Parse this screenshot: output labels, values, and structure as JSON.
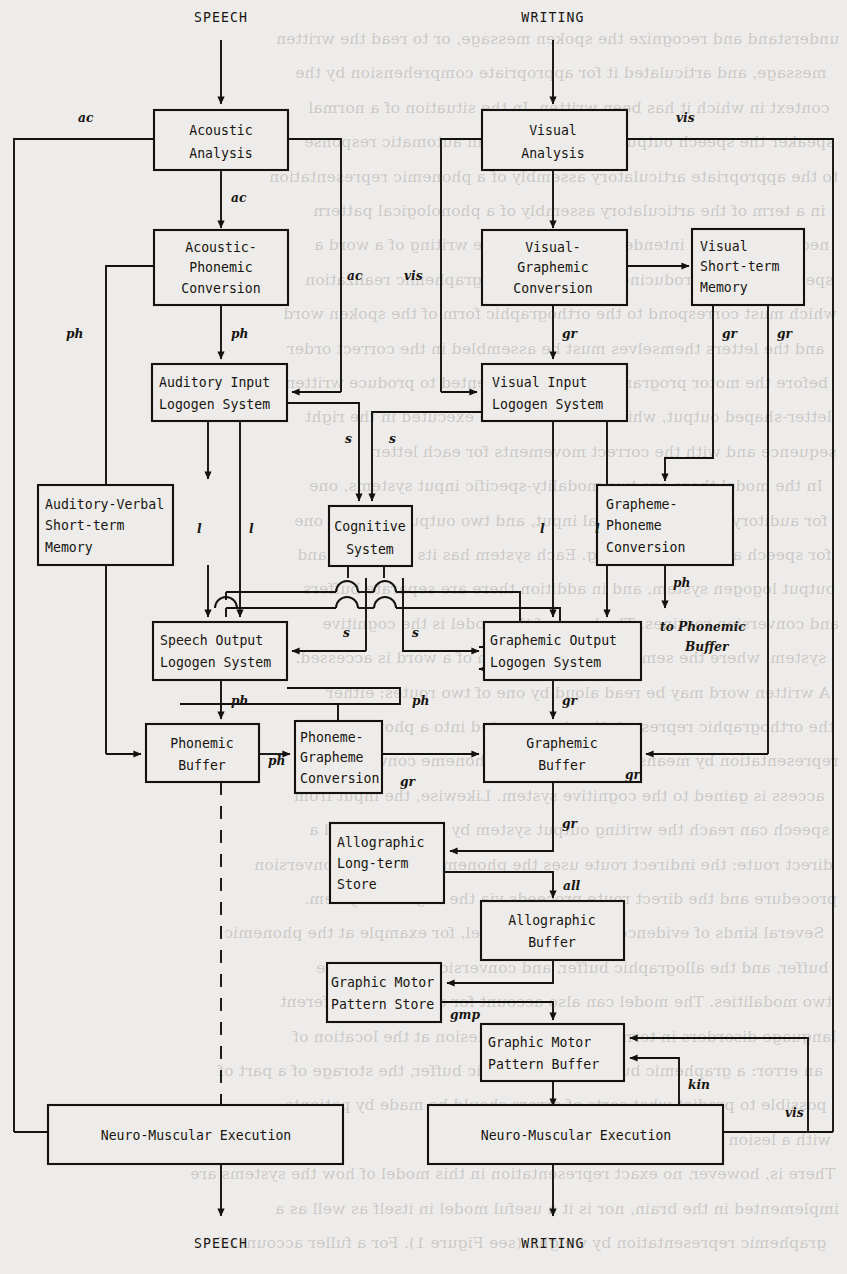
{
  "diagram": {
    "io_labels": {
      "speech_in": "SPEECH",
      "writing_in": "WRITING",
      "speech_out": "SPEECH",
      "writing_out": "WRITING"
    },
    "boxes": [
      {
        "id": "acoustic_analysis",
        "lines": [
          "Acoustic",
          "Analysis"
        ]
      },
      {
        "id": "visual_analysis",
        "lines": [
          "Visual",
          "Analysis"
        ]
      },
      {
        "id": "acoustic_phonemic",
        "lines": [
          "Acoustic-",
          "Phonemic",
          "Conversion"
        ]
      },
      {
        "id": "visual_graphemic",
        "lines": [
          "Visual-",
          "Graphemic",
          "Conversion"
        ]
      },
      {
        "id": "visual_stm",
        "lines": [
          "Visual",
          "Short-term",
          "Memory"
        ]
      },
      {
        "id": "auditory_input",
        "lines": [
          "Auditory Input",
          "Logogen System"
        ]
      },
      {
        "id": "visual_input",
        "lines": [
          "Visual Input",
          "Logogen System"
        ]
      },
      {
        "id": "auditory_verbal_stm",
        "lines": [
          "Auditory-Verbal",
          "Short-term",
          "Memory"
        ]
      },
      {
        "id": "cognitive_system",
        "lines": [
          "Cognitive",
          "System"
        ]
      },
      {
        "id": "grapheme_phoneme",
        "lines": [
          "Grapheme-",
          "Phoneme",
          "Conversion"
        ]
      },
      {
        "id": "speech_output",
        "lines": [
          "Speech Output",
          "Logogen System"
        ]
      },
      {
        "id": "graphemic_output",
        "lines": [
          "Graphemic Output",
          "Logogen System"
        ]
      },
      {
        "id": "phonemic_buffer",
        "lines": [
          "Phonemic",
          "Buffer"
        ]
      },
      {
        "id": "phoneme_grapheme",
        "lines": [
          "Phoneme-",
          "Grapheme",
          "Conversion"
        ]
      },
      {
        "id": "graphemic_buffer",
        "lines": [
          "Graphemic",
          "Buffer"
        ]
      },
      {
        "id": "allographic_lts",
        "lines": [
          "Allographic",
          "Long-term",
          "Store"
        ]
      },
      {
        "id": "allographic_buffer",
        "lines": [
          "Allographic",
          "Buffer"
        ]
      },
      {
        "id": "gmp_store",
        "lines": [
          "Graphic Motor",
          "Pattern Store"
        ]
      },
      {
        "id": "gmp_buffer",
        "lines": [
          "Graphic Motor",
          "Pattern Buffer"
        ]
      },
      {
        "id": "nme_speech",
        "lines": [
          "Neuro-Muscular Execution"
        ]
      },
      {
        "id": "nme_writing",
        "lines": [
          "Neuro-Muscular Execution"
        ]
      }
    ],
    "edge_labels": [
      {
        "id": "ac_left",
        "text": "ac"
      },
      {
        "id": "vis_right",
        "text": "vis"
      },
      {
        "id": "ac_down1",
        "text": "ac"
      },
      {
        "id": "ac_mid",
        "text": "ac"
      },
      {
        "id": "vis_mid",
        "text": "vis"
      },
      {
        "id": "ph_aux",
        "text": "ph"
      },
      {
        "id": "ph_down1",
        "text": "ph"
      },
      {
        "id": "gr_down1",
        "text": "gr"
      },
      {
        "id": "gr_stm_a",
        "text": "gr"
      },
      {
        "id": "gr_stm_b",
        "text": "gr"
      },
      {
        "id": "s_left_up",
        "text": "s"
      },
      {
        "id": "s_right_up",
        "text": "s"
      },
      {
        "id": "l_1",
        "text": "l"
      },
      {
        "id": "l_2",
        "text": "l"
      },
      {
        "id": "l_3",
        "text": "l"
      },
      {
        "id": "l_4",
        "text": "l"
      },
      {
        "id": "s_left_dn",
        "text": "s"
      },
      {
        "id": "s_right_dn",
        "text": "s"
      },
      {
        "id": "ph_gp_out",
        "text": "ph"
      },
      {
        "id": "to_phonemic",
        "text": "to Phonemic"
      },
      {
        "id": "to_phonemic_2",
        "text": "Buffer"
      },
      {
        "id": "ph_speech_out",
        "text": "ph"
      },
      {
        "id": "ph_top_right",
        "text": "ph"
      },
      {
        "id": "gr_go_out",
        "text": "gr"
      },
      {
        "id": "ph_pb_out",
        "text": "ph"
      },
      {
        "id": "gr_pgc_out",
        "text": "gr"
      },
      {
        "id": "gr_vstm_in",
        "text": "gr"
      },
      {
        "id": "gr_gb_down",
        "text": "gr"
      },
      {
        "id": "all_label",
        "text": "all"
      },
      {
        "id": "gmp_label",
        "text": "gmp"
      },
      {
        "id": "kin_label",
        "text": "kin"
      },
      {
        "id": "vis_bottom",
        "text": "vis"
      }
    ],
    "colors": {
      "ink": "#14120e",
      "paper": "#eeecea"
    }
  },
  "bleed_text": [
    "understand and recognize the spoken message, or to read the written",
    "message, and articulated it for appropriate comprehension by the",
    "context in which it has been written. In the situation of a normal",
    "speaker the speech output is generated as an automatic response",
    "to the appropriate articulatory assembly of a phonemic representation",
    "in a term of the articulatory assembly of a phonological pattern",
    "necessary for the intended utterance. In the writing of a word a",
    "speaker may be producing for the reader a graphemic realization",
    "which must correspond to the orthographic form of the spoken word",
    "and the letters themselves must be assembled in the correct order",
    "before the motor programs can be implemented to produce written",
    "letter-shaped output, which in turn must be executed in the right",
    "sequence and with the correct movements for each letter.",
    "In the model there are two modality-specific input systems, one",
    "for auditory and one for visual input, and two output systems, one",
    "for speech and one for writing. Each system has its own input and",
    "output logogen system, and in addition there are separate buffers",
    "and conversion routines. The heart of the model is the cognitive",
    "system, where the semantic representation of a word is accessed.",
    "A written word may be read aloud by one of two routes: either",
    "the orthographic representation is converted into a phonemic",
    "representation by means of the grapheme-phoneme conversion, or",
    "access is gained to the cognitive system. Likewise, the input from",
    "speech can reach the writing output system by an indirect and a",
    "direct route: the indirect route uses the phoneme-grapheme conversion",
    "procedure and the direct route proceeds via the cognitive system.",
    "Several kinds of evidence support the model, for example at the phonemic",
    "buffer, and the allographic buffer, and conversions between the",
    "two modalities. The model can also account for a variety of different",
    "language disorders in terms of a functional lesion at the location of",
    "an error: a graphemic buffer, an allographic buffer, the storage of a part of",
    "possible to predict what sorts of errors should be made by patients",
    "with a lesion at each point in the system.",
    "There is, however, no exact representation in this model of how the systems are",
    "implemented in the brain, nor is it a useful model in itself as well as a",
    "graphemic representation by weight. (see Figure 1). For a fuller account of"
  ]
}
